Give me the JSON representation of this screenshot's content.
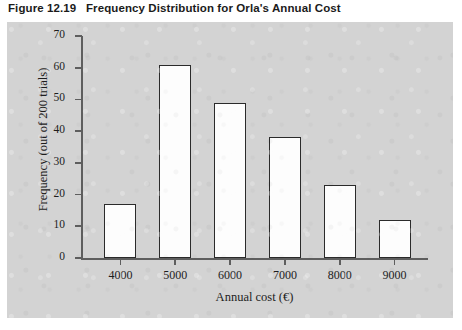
{
  "figure": {
    "number": "Figure 12.19",
    "title": "Frequency Distribution for Orla's Annual Cost"
  },
  "chart_data": {
    "type": "bar",
    "title": "Frequency Distribution for Orla's Annual Cost",
    "categories": [
      "4000",
      "5000",
      "6000",
      "7000",
      "8000",
      "9000"
    ],
    "values": [
      17,
      61,
      49,
      38,
      23,
      12
    ],
    "xlabel": "Annual cost (€)",
    "ylabel": "Frequency (out of 200 trials)",
    "ylim": [
      0,
      70
    ],
    "yticks": [
      0,
      10,
      20,
      30,
      40,
      50,
      60,
      70
    ],
    "ytick_labels": [
      "0",
      "10",
      "20",
      "30",
      "40",
      "50",
      "60",
      "70"
    ],
    "grid": false,
    "legend": null,
    "bar_face_color": "#fdfdfd",
    "bar_edge_color": "#2b2b2b",
    "panel_color": "#d3d3d3",
    "axis_color": "#5e5e5e"
  }
}
